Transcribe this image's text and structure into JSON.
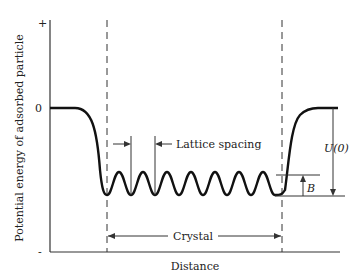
{
  "diagram": {
    "y_axis_label": "Potential energy of adsorbed particle",
    "x_axis_label": "Distance",
    "y_ticks": {
      "plus": "+",
      "zero": "0",
      "minus": "-"
    },
    "annotations": {
      "lattice_spacing": "Lattice spacing",
      "crystal": "Crystal",
      "barrier_height": "B",
      "binding_energy": "U(0)"
    },
    "colors": {
      "curve": "#111111",
      "text": "#222222",
      "background": "#ffffff"
    }
  }
}
